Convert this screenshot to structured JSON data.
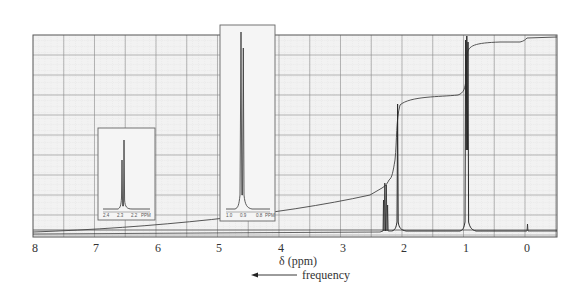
{
  "chart_data": {
    "type": "line",
    "title": "",
    "xlabel": "δ (ppm)",
    "ylabel": "",
    "xlim": [
      8,
      -0.5
    ],
    "x_reversed": true,
    "grid": true,
    "x_ticks": [
      "8",
      "7",
      "6",
      "5",
      "4",
      "3",
      "2",
      "1",
      "0"
    ],
    "annotation": "frequency",
    "annotation_arrow": "left",
    "series": [
      {
        "name": "spectrum",
        "peaks": [
          {
            "ppm": 2.35,
            "multiplicity": "quartet",
            "relative_height": 0.27
          },
          {
            "ppm": 2.12,
            "multiplicity": "singlet",
            "relative_height": 0.65
          },
          {
            "ppm": 0.95,
            "multiplicity": "triplet",
            "relative_height": 1.0
          },
          {
            "ppm": 0.0,
            "multiplicity": "singlet",
            "label": "TMS",
            "relative_height": 0.06
          }
        ]
      },
      {
        "name": "integration",
        "steps": [
          {
            "ppm": 2.35,
            "relative_rise": 0.25
          },
          {
            "ppm": 2.12,
            "relative_rise": 0.38
          },
          {
            "ppm": 0.95,
            "relative_rise": 0.37
          }
        ]
      }
    ],
    "insets": [
      {
        "name": "expansion-2.3",
        "x_ticks": [
          "2.4",
          "2.3",
          "2.2"
        ],
        "unit": "PPM",
        "peaks": "quartet"
      },
      {
        "name": "expansion-0.9",
        "x_ticks": [
          "1.0",
          "0.9",
          "0.8"
        ],
        "unit": "PPM",
        "peaks": "triplet"
      }
    ]
  },
  "axis": {
    "ticks": [
      {
        "label": "8",
        "ppm": 8
      },
      {
        "label": "7",
        "ppm": 7
      },
      {
        "label": "6",
        "ppm": 6
      },
      {
        "label": "5",
        "ppm": 5
      },
      {
        "label": "4",
        "ppm": 4
      },
      {
        "label": "3",
        "ppm": 3
      },
      {
        "label": "2",
        "ppm": 2
      },
      {
        "label": "1",
        "ppm": 1
      },
      {
        "label": "0",
        "ppm": 0
      }
    ],
    "title": "δ (ppm)",
    "frequency_label": "frequency"
  },
  "insets": {
    "left": {
      "ticks": [
        "2.4",
        "2.3",
        "2.2"
      ],
      "unit": "PPM"
    },
    "right": {
      "ticks": [
        "1.0",
        "0.9",
        "0.8"
      ],
      "unit": "PPM"
    }
  },
  "colors": {
    "grid_major": "#8a8a8a",
    "grid_minor": "#c8c8c8",
    "plot_bg": "#efefef",
    "trace": "#333333",
    "frame": "#555555"
  }
}
